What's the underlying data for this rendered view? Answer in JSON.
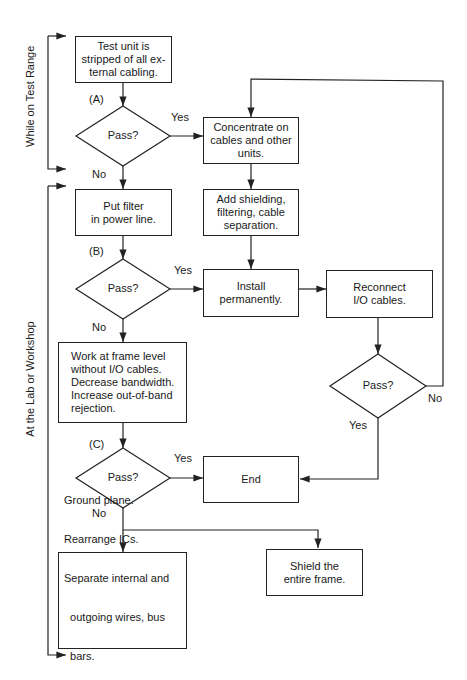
{
  "side_labels": {
    "test_range": "While on Test Range",
    "lab": "At the Lab or Workshop"
  },
  "boxes": {
    "strip": "Test unit is\nstripped of all ex-\nternal cabling.",
    "concentrate": "Concentrate on\ncables and other\nunits.",
    "filter": "Put filter\nin power line.",
    "shielding": "Add shielding,\nfiltering, cable\nseparation.",
    "install": "Install\npermanently.",
    "reconnect": "Reconnect\nI/O cables.",
    "frame": "Work at frame level\n  without I/O cables.\nDecrease bandwidth.\nIncrease out-of-band\n  rejection.",
    "end": "End",
    "ground_lines": [
      "Ground plane.",
      "Rearrange ICs.",
      "Separate internal and",
      "  outgoing wires, bus",
      "  bars."
    ],
    "ground_last_prefix": "Add 0",
    "ground_last_sub": "V",
    "ground_last_suffix": " connections, etc.",
    "shield": "Shield the\nentire frame."
  },
  "decisions": {
    "a": "Pass?",
    "b": "Pass?",
    "c": "Pass?",
    "io": "Pass?"
  },
  "stage_labels": {
    "a": "(A)",
    "b": "(B)",
    "c": "(C)"
  },
  "edge_labels": {
    "a_yes": "Yes",
    "a_no": "No",
    "b_yes": "Yes",
    "b_no": "No",
    "c_yes": "Yes",
    "c_no": "No",
    "io_yes": "Yes",
    "io_no": "No"
  }
}
